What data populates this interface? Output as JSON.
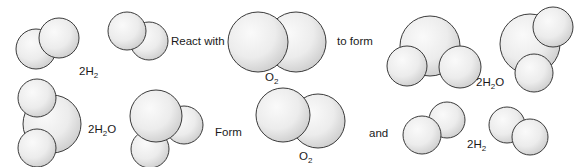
{
  "diagram": {
    "colors": {
      "atom_fill": "#f0f0f0",
      "atom_shade": "#c4c4c4",
      "atom_stroke": "#3a3a3a",
      "text": "#1a1a1a"
    },
    "top_row": {
      "reactant1": {
        "coef": "2",
        "base": "H",
        "sub": "2"
      },
      "verb": "React with",
      "reactant2": {
        "coef": "",
        "base": "O",
        "sub": "2"
      },
      "connector": "to form",
      "product": {
        "coef": "2",
        "base": "H",
        "sub": "2",
        "tail": "O"
      }
    },
    "bottom_row": {
      "reactant": {
        "coef": "2",
        "base": "H",
        "sub": "2",
        "tail": "O"
      },
      "verb": "Form",
      "product1": {
        "coef": "",
        "base": "O",
        "sub": "2"
      },
      "connector": "and",
      "product2": {
        "coef": "2",
        "base": "H",
        "sub": "2"
      }
    }
  }
}
